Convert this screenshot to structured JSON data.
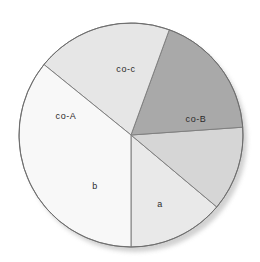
{
  "chart_data": {
    "type": "pie",
    "title": "",
    "subtitle": "",
    "xlabel": "",
    "ylabel": "",
    "legend_position": "none",
    "grid": false,
    "labels_inside_slices": true,
    "total_degrees": 360,
    "start_angle_deg": 270,
    "direction": "counterclockwise",
    "categories": [
      "a",
      "co-B",
      "co-c",
      "co-A",
      "b"
    ],
    "values": [
      13.9,
      12.2,
      18.3,
      19.7,
      21.1
    ],
    "slices": [
      {
        "label": "a",
        "value": 13.9,
        "percent": 13.9,
        "start_deg": 270,
        "end_deg": 320,
        "sweep_deg": 50,
        "color": "#e9e9e9",
        "label_x": 160,
        "label_y": 205
      },
      {
        "label": "co-B",
        "value": 12.2,
        "percent": 12.2,
        "start_deg": 320,
        "end_deg": 364,
        "sweep_deg": 44,
        "color": "#d6d6d6",
        "label_x": 196,
        "label_y": 120
      },
      {
        "label": "co-c",
        "value": 18.3,
        "percent": 18.3,
        "start_deg": 4,
        "end_deg": 70,
        "sweep_deg": 66,
        "color": "#a9a9a9",
        "label_x": 126,
        "label_y": 70
      },
      {
        "label": "co-A",
        "value": 19.7,
        "percent": 19.7,
        "start_deg": 70,
        "end_deg": 141,
        "sweep_deg": 71,
        "color": "#e6e6e6",
        "label_x": 66,
        "label_y": 117
      },
      {
        "label": "b",
        "value": 21.1,
        "percent": 21.1,
        "start_deg": 141,
        "end_deg": 270,
        "sweep_deg": 129,
        "color": "#f8f8f8",
        "label_x": 95,
        "label_y": 187
      }
    ],
    "geometry": {
      "center_x": 131,
      "center_y": 135,
      "radius": 112
    },
    "style": {
      "background": "#ffffff",
      "outline_color": "#6e6e6e",
      "outline_width": 1,
      "divider_color": "#808080",
      "divider_width": 1,
      "shadow_color": "#c9c9c9",
      "label_color": "#2b2b2b"
    }
  }
}
